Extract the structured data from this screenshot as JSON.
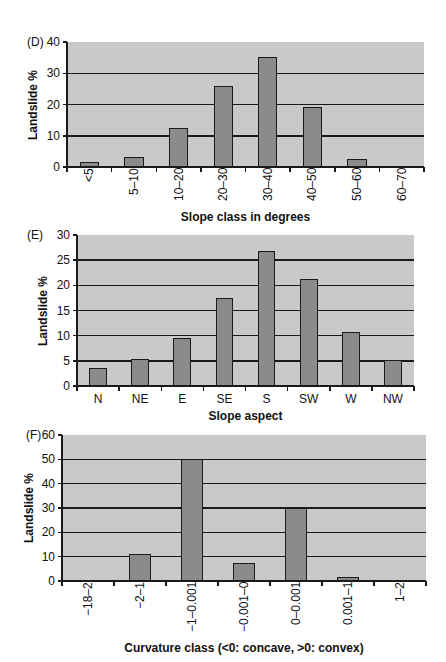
{
  "chart_data": [
    {
      "type": "bar",
      "panel": "(D)",
      "title": "",
      "xlabel": "Slope class in degrees",
      "ylabel": "Landslide %",
      "categories": [
        "<5",
        "5–10",
        "10–20",
        "20–30",
        "30–40",
        "40–50",
        "50–60",
        "60–70"
      ],
      "values": [
        1.5,
        3.3,
        12.4,
        26,
        35.3,
        19.1,
        2.5,
        0
      ],
      "ylim": [
        0,
        40
      ],
      "yticks": [
        0,
        10,
        20,
        30,
        40
      ],
      "grid": true,
      "xtick_rotation": -90,
      "colors": {
        "plot_bg": "#c9c9c9",
        "bar": "#8b8b8b",
        "edge": "#1a1a1a"
      }
    },
    {
      "type": "bar",
      "panel": "(E)",
      "title": "",
      "xlabel": "Slope aspect",
      "ylabel": "Landslide %",
      "categories": [
        "N",
        "NE",
        "E",
        "SE",
        "S",
        "SW",
        "W",
        "NW"
      ],
      "values": [
        3.6,
        5.4,
        9.6,
        17.5,
        26.9,
        21.3,
        10.7,
        5.2
      ],
      "ylim": [
        0,
        30
      ],
      "yticks": [
        0,
        5,
        10,
        15,
        20,
        25,
        30
      ],
      "grid": true,
      "xtick_rotation": 0,
      "colors": {
        "plot_bg": "#c9c9c9",
        "bar": "#8b8b8b",
        "edge": "#1a1a1a"
      }
    },
    {
      "type": "bar",
      "panel": "(F)",
      "title": "",
      "xlabel": "Curvature class (<0: concave, >0: convex)",
      "ylabel": "Landslide %",
      "categories": [
        "−18–2",
        "−2–1",
        "−1–0.001",
        "−0.001–0",
        "0–0.001",
        "0.001–1",
        "1–2"
      ],
      "values": [
        0,
        11,
        50,
        7.4,
        30,
        1.8,
        0
      ],
      "ylim": [
        0,
        60
      ],
      "yticks": [
        0,
        10,
        20,
        30,
        40,
        50,
        60
      ],
      "grid": true,
      "xtick_rotation": -90,
      "colors": {
        "plot_bg": "#c9c9c9",
        "bar": "#8b8b8b",
        "edge": "#1a1a1a"
      }
    }
  ]
}
